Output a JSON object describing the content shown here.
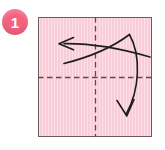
{
  "figure": {
    "background_color": "#fefefe"
  },
  "step_badge": {
    "number": "1",
    "fill_color": "#f4617f",
    "text_color": "#ffffff",
    "shape": "circle",
    "cx": 15,
    "cy": 22,
    "r": 13
  },
  "paper": {
    "label": "square paper sheet",
    "fill_color": "#f9cdd8",
    "border_color": "#6d5b5b",
    "x": 38,
    "y": 17,
    "width": 114,
    "height": 120
  },
  "crease_lines": [
    {
      "name": "vertical-crease",
      "style": "dashed",
      "color": "#5d4a4a",
      "x1": 95.5,
      "y1": 17,
      "x2": 95.5,
      "y2": 137
    },
    {
      "name": "horizontal-crease",
      "style": "dashed",
      "color": "#5d4a4a",
      "x1": 38,
      "y1": 77.5,
      "x2": 152,
      "y2": 77.5
    }
  ],
  "arrows": [
    {
      "name": "left-fold-arrow",
      "direction": "left",
      "color": "#1d1d1d",
      "path": "M150,57 C128,50 96,43 64,43.5",
      "head": "M73,38 L59.5,43.8 L73,49.5",
      "description": "curved arrow sweeping leftward across the sheet"
    },
    {
      "name": "down-fold-arrow",
      "direction": "down",
      "color": "#1d1d1d",
      "path": "M64,63 C92,56 114,46 129,35 C141,56 139,90 126,114",
      "head": "M117,101 L126.5,115.5 L133.5,100",
      "description": "curved arrow sweeping up-right then down the right half"
    }
  ],
  "colors": {
    "accent": "#f4617f",
    "paper": "#f9cdd8",
    "outline": "#6d5b5b",
    "ink": "#1d1d1d",
    "background": "#fefefe"
  }
}
